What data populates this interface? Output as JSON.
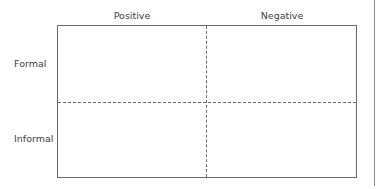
{
  "diagram": {
    "type": "2x2 matrix",
    "columns": [
      {
        "label": "Positive"
      },
      {
        "label": "Negative"
      }
    ],
    "rows": [
      {
        "label": "Formal"
      },
      {
        "label": "Informal"
      }
    ],
    "quadrants": [
      {
        "row": "Formal",
        "column": "Positive",
        "content": ""
      },
      {
        "row": "Formal",
        "column": "Negative",
        "content": ""
      },
      {
        "row": "Informal",
        "column": "Positive",
        "content": ""
      },
      {
        "row": "Informal",
        "column": "Negative",
        "content": ""
      }
    ],
    "colors": {
      "border": "#6a6a6a",
      "text": "#3d3d3d",
      "background": "#ffffff"
    }
  }
}
